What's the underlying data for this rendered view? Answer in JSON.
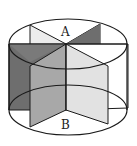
{
  "figure": {
    "labels": {
      "top": "A",
      "bottom": "B"
    },
    "colors": {
      "stroke": "#1a1a1a",
      "dark_fill": "#6e6e6e",
      "mid_fill": "#a8a8a8",
      "light_fill": "#e2e2e2",
      "background": "#ffffff"
    }
  }
}
